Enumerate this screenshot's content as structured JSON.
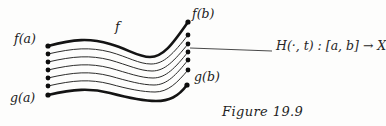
{
  "figure": {
    "caption": "Figure 19.9",
    "background_color": "#fdfdfc",
    "ink_color": "#141414",
    "width": 386,
    "height": 126
  },
  "labels": {
    "f_of_a": "f(a)",
    "g_of_a": "g(a)",
    "f_of_b": "f(b)",
    "g_of_b": "g(b)",
    "top_curve_name": "f",
    "homotopy_map": "H(·, t) : [a, b] → X"
  },
  "chart_data": {
    "type": "line",
    "title": "Figure 19.9",
    "xlabel": "",
    "ylabel": "",
    "grid": false,
    "legend": "none",
    "xlim": [
      48,
      190
    ],
    "ylim": [
      22,
      95
    ],
    "series": [
      {
        "name": "f",
        "style": "bold",
        "stroke_width": 2.6,
        "start_label": "f(a)",
        "end_label": "f(b)",
        "path": "M48,46 C74,39 90,38 110,44 C128,49 138,57 150,57 C163,57 172,45 188,22"
      },
      {
        "name": "H(.,t1)",
        "style": "thin",
        "stroke_width": 0.95,
        "path": "M48,54 C74,48 90,47 110,52 C128,57 139,64 151,64 C164,64 173,54 188,35"
      },
      {
        "name": "H(.,t2)",
        "style": "thin",
        "stroke_width": 0.95,
        "path": "M48,62 C74,56 90,55 110,60 C128,65 140,71 152,71 C165,71 174,61 188,44"
      },
      {
        "name": "H(.,t3)",
        "style": "thin",
        "stroke_width": 0.95,
        "path": "M48,70 C74,64 90,63 110,68 C128,73 141,78 153,78 C166,78 175,68 188,52"
      },
      {
        "name": "H(.,t4)",
        "style": "thin",
        "stroke_width": 0.95,
        "path": "M48,78 C74,72 90,71 110,76 C128,81 142,85 154,85 C167,85 176,75 188,60"
      },
      {
        "name": "H(.,t5)",
        "style": "thin",
        "stroke_width": 0.95,
        "path": "M48,86 C74,80 90,79 110,84 C128,89 143,92 155,92 C168,92 177,83 188,70"
      },
      {
        "name": "g",
        "style": "bold",
        "stroke_width": 2.6,
        "start_label": "g(a)",
        "end_label": "g(b)",
        "path": "M48,95 C74,89 90,88 110,93 C129,98 144,101 156,101 C169,101 178,97 187,85"
      }
    ],
    "left_endpoints": [
      {
        "x": 48,
        "y": 46,
        "label": "f(a)"
      },
      {
        "x": 48,
        "y": 54,
        "label": ""
      },
      {
        "x": 48,
        "y": 62,
        "label": ""
      },
      {
        "x": 48,
        "y": 70,
        "label": ""
      },
      {
        "x": 48,
        "y": 78,
        "label": ""
      },
      {
        "x": 48,
        "y": 86,
        "label": ""
      },
      {
        "x": 48,
        "y": 95,
        "label": "g(a)"
      }
    ],
    "right_endpoints": [
      {
        "x": 188,
        "y": 22,
        "label": "f(b)"
      },
      {
        "x": 188,
        "y": 35,
        "label": ""
      },
      {
        "x": 188,
        "y": 44,
        "label": ""
      },
      {
        "x": 188,
        "y": 52,
        "label": ""
      },
      {
        "x": 188,
        "y": 60,
        "label": ""
      },
      {
        "x": 188,
        "y": 70,
        "label": ""
      },
      {
        "x": 187,
        "y": 85,
        "label": "g(b)"
      }
    ],
    "annotations": [
      {
        "text": "H(·, t) : [a, b] → X",
        "leader_from": [
          190,
          48
        ],
        "leader_to": [
          272,
          51
        ]
      },
      {
        "text": "f",
        "at": [
          118,
          27
        ]
      }
    ]
  }
}
